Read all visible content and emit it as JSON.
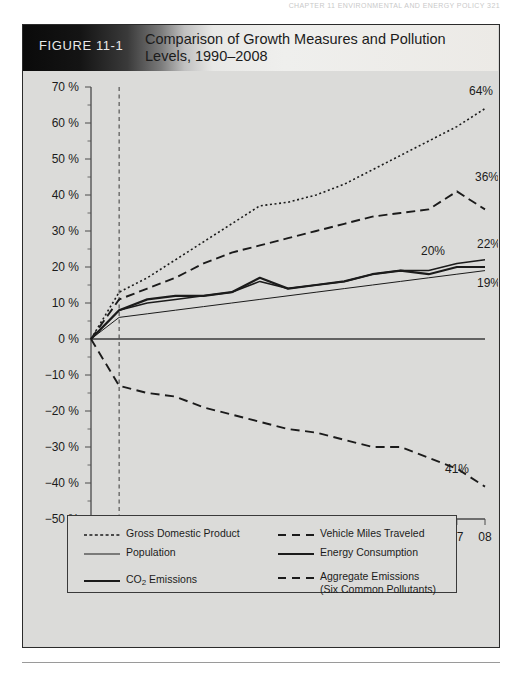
{
  "running_head": "CHAPTER 11  ENVIRONMENTAL AND ENERGY POLICY    321",
  "figure": {
    "number_label": "FIGURE 11-1",
    "title": "Comparison of Growth Measures and Pollution Levels, 1990–2008"
  },
  "legend": {
    "left": [
      {
        "label": "Gross Domestic Product",
        "style": "dotted",
        "weight": 1.4
      },
      {
        "label": "Population",
        "style": "solid",
        "weight": 1.1
      },
      {
        "label": "CO2 Emissions",
        "style": "solid",
        "weight": 2.0,
        "has_subscript": true,
        "pre": "CO",
        "sub": "2",
        "post": " Emissions"
      }
    ],
    "right": [
      {
        "label": "Vehicle Miles Traveled",
        "style": "dashed",
        "weight": 1.8
      },
      {
        "label": "Energy Consumption",
        "style": "solid",
        "weight": 1.8
      },
      {
        "label": "Aggregate Emissions",
        "label2": "(Six Common Pollutants)",
        "style": "dashed",
        "weight": 1.8
      }
    ]
  },
  "chart_data": {
    "type": "line",
    "title": "Comparison of Growth Measures and Pollution Levels, 1990–2008",
    "xlabel": "",
    "ylabel": "",
    "x": [
      "90",
      "95",
      "96",
      "97",
      "98",
      "99",
      "00",
      "01",
      "02",
      "03",
      "04",
      "05",
      "06",
      "07",
      "08"
    ],
    "xlim": [
      0,
      14
    ],
    "ylim": [
      -50,
      70
    ],
    "ytick_values": [
      70,
      60,
      50,
      40,
      30,
      20,
      10,
      0,
      -10,
      -20,
      -30,
      -40,
      -50
    ],
    "ytick_labels": [
      "70 %",
      "60 %",
      "50 %",
      "40 %",
      "30 %",
      "20 %",
      "10 %",
      "0 %",
      "−10 %",
      "−20 %",
      "−30 %",
      "−40 %",
      "−50 %"
    ],
    "grid": false,
    "legend_position": "below",
    "reference_line": {
      "x_index": 1,
      "x_label": "95",
      "style": "dashed"
    },
    "zero_line": true,
    "series": [
      {
        "name": "Gross Domestic Product",
        "style": "dotted",
        "end_label": "64%",
        "values": [
          0,
          13,
          17,
          22,
          27,
          32,
          37,
          38,
          40,
          43,
          47,
          51,
          55,
          59,
          64
        ]
      },
      {
        "name": "Vehicle Miles Traveled",
        "style": "dashed",
        "end_label": "36%",
        "values": [
          0,
          11,
          14,
          17,
          21,
          24,
          26,
          28,
          30,
          32,
          34,
          35,
          36,
          41,
          36
        ]
      },
      {
        "name": "Energy Consumption",
        "style": "solid",
        "end_label": "22%",
        "values": [
          0,
          8,
          10,
          11,
          12,
          13,
          16,
          14,
          15,
          16,
          18,
          19,
          19,
          21,
          22
        ]
      },
      {
        "name": "CO2 Emissions",
        "style": "solid-thick",
        "end_label": "20%",
        "values": [
          0,
          8,
          11,
          12,
          12,
          13,
          17,
          14,
          15,
          16,
          18,
          19,
          18,
          20,
          20
        ]
      },
      {
        "name": "Population",
        "style": "solid-thin",
        "end_label": "19%",
        "values": [
          0,
          6,
          7,
          8,
          9,
          10,
          11,
          12,
          13,
          14,
          15,
          16,
          17,
          18,
          19
        ]
      },
      {
        "name": "Aggregate Emissions (Six Common Pollutants)",
        "style": "dashed-long",
        "end_label": "41%",
        "values": [
          0,
          -13,
          -15,
          -16,
          -19,
          -21,
          -23,
          -25,
          -26,
          -28,
          -30,
          -30,
          -33,
          -36,
          -41
        ]
      }
    ],
    "value_annotations": [
      {
        "text": "64%",
        "series": "Gross Domestic Product"
      },
      {
        "text": "36%",
        "series": "Vehicle Miles Traveled"
      },
      {
        "text": "22%",
        "series": "Energy Consumption"
      },
      {
        "text": "20%",
        "series": "CO2 Emissions"
      },
      {
        "text": "19%",
        "series": "Population"
      },
      {
        "text": "41%",
        "series": "Aggregate Emissions (Six Common Pollutants)"
      }
    ]
  },
  "colors": {
    "figure_bg": "#dbdbd9",
    "ink": "#1b1b1b",
    "frame": "#2b2b2b",
    "header_dark": "#0a0a0a",
    "header_light": "#efefed"
  }
}
